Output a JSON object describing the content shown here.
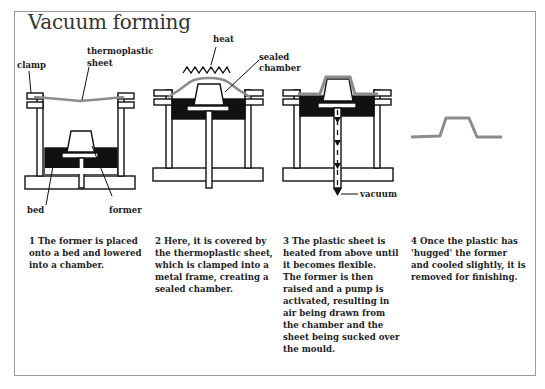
{
  "title": "Vacuum forming",
  "colors": {
    "ink": "#111111",
    "sheet_grey": "#8c8c8c",
    "frame_border": "#9a9a9a",
    "background": "#ffffff"
  },
  "labels": {
    "clamp": "clamp",
    "thermoplastic": "thermoplastic",
    "sheet": "sheet",
    "bed": "bed",
    "former": "former",
    "heat": "heat",
    "sealed": "sealed",
    "chamber": "chamber",
    "vacuum": "vacuum"
  },
  "steps": [
    {
      "number": "1",
      "lines": [
        "1  The former is placed",
        "onto a bed and lowered",
        "into a chamber."
      ]
    },
    {
      "number": "2",
      "lines": [
        "2  Here, it is covered by",
        "the thermoplastic sheet,",
        "which is clamped into a",
        "metal frame, creating a",
        "sealed chamber."
      ]
    },
    {
      "number": "3",
      "lines": [
        "3  The plastic sheet is",
        "heated from above until",
        "it becomes flexible.",
        "The former is then",
        "raised and a pump is",
        "activated, resulting in",
        "air being drawn from",
        "the chamber and the",
        "sheet being sucked over",
        "the mould."
      ]
    },
    {
      "number": "4",
      "lines": [
        "4  Once the plastic has",
        "'hugged' the former",
        "and cooled slightly, it is",
        "removed for finishing."
      ]
    }
  ]
}
